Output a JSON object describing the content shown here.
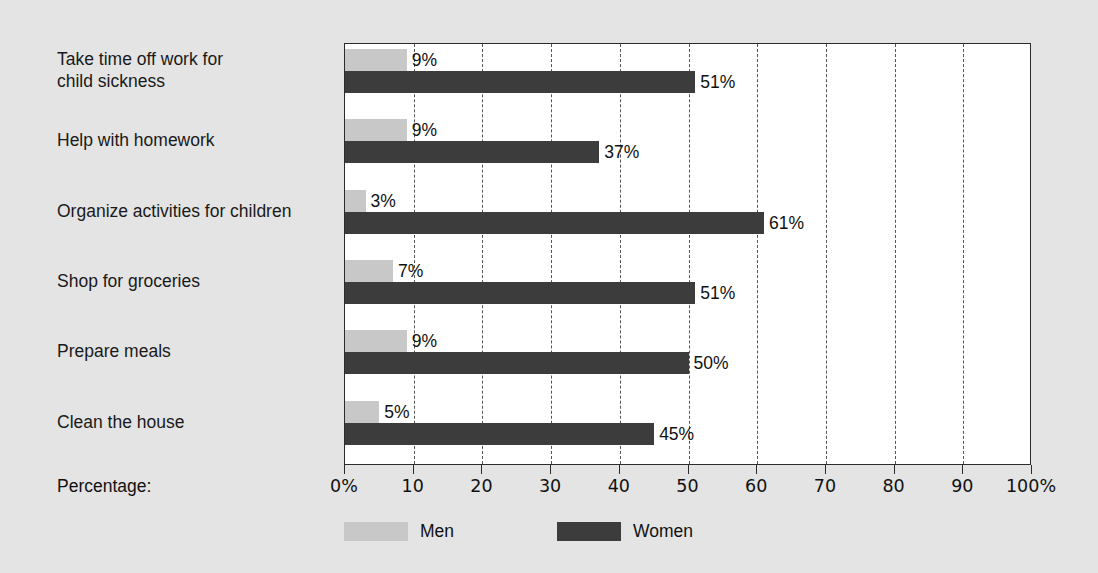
{
  "chart_data": {
    "type": "bar",
    "orientation": "horizontal",
    "title": "",
    "subtitle": "",
    "xlabel": "Percentage:",
    "ylabel": "",
    "xlim": [
      0,
      100
    ],
    "grid": true,
    "grid_axis": "x",
    "grid_style": "dashed",
    "legend_position": "bottom",
    "categories": [
      "Take time off work for\nchild sickness",
      "Help with homework",
      "Organize activities for children",
      "Shop for groceries",
      "Prepare meals",
      "Clean the house"
    ],
    "series": [
      {
        "name": "Men",
        "color": "#c8c8c8",
        "values": [
          9,
          9,
          3,
          7,
          9,
          5
        ],
        "value_labels": [
          "9%",
          "9%",
          "3%",
          "7%",
          "9%",
          "5%"
        ]
      },
      {
        "name": "Women",
        "color": "#3c3c3c",
        "values": [
          51,
          37,
          61,
          51,
          50,
          45
        ],
        "value_labels": [
          "51%",
          "37%",
          "61%",
          "51%",
          "50%",
          "45%"
        ]
      }
    ],
    "xticks": [
      0,
      10,
      20,
      30,
      40,
      50,
      60,
      70,
      80,
      90,
      100
    ],
    "xtick_labels": [
      "0%",
      "10",
      "20",
      "30",
      "40",
      "50",
      "60",
      "70",
      "80",
      "90",
      "100%"
    ]
  },
  "colors": {
    "background": "#e4e4e4",
    "plot_background": "#ffffff",
    "axis": "#2b2b2b",
    "grid": "#555555",
    "men": "#c8c8c8",
    "women": "#3c3c3c",
    "text": "#111111"
  }
}
